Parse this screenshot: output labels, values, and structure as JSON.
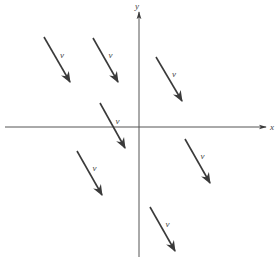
{
  "diagram": {
    "type": "vector-field",
    "axes": {
      "x_label": "x",
      "y_label": "y",
      "origin": [
        139,
        127
      ]
    },
    "vector_label": "v",
    "colors": {
      "stroke": "#3a3a3a",
      "label": "#444444"
    },
    "vectors": [
      {
        "x1": 44,
        "y1": 37,
        "x2": 70,
        "y2": 82,
        "label": "v"
      },
      {
        "x1": 93,
        "y1": 38,
        "x2": 118,
        "y2": 82,
        "label": "v"
      },
      {
        "x1": 156,
        "y1": 57,
        "x2": 182,
        "y2": 101,
        "label": "v"
      },
      {
        "x1": 100,
        "y1": 103,
        "x2": 125,
        "y2": 148,
        "label": "v"
      },
      {
        "x1": 77,
        "y1": 151,
        "x2": 102,
        "y2": 195,
        "label": "v"
      },
      {
        "x1": 185,
        "y1": 139,
        "x2": 210,
        "y2": 183,
        "label": "v"
      },
      {
        "x1": 150,
        "y1": 207,
        "x2": 175,
        "y2": 251,
        "label": "v"
      }
    ]
  }
}
